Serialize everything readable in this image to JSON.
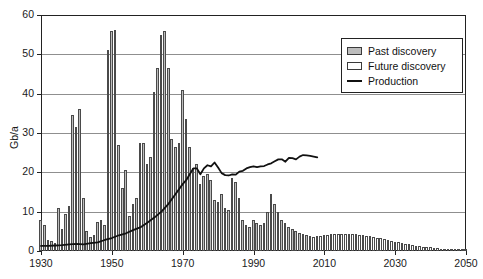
{
  "chart_data": {
    "type": "bar",
    "title": "",
    "xlabel": "",
    "ylabel": "Gb/a",
    "xlim": [
      1930,
      2050
    ],
    "ylim": [
      0,
      60
    ],
    "grid": "horizontal",
    "legend_position": "top-right",
    "x_ticks": [
      1930,
      1950,
      1970,
      1990,
      2010,
      2030,
      2050
    ],
    "y_ticks": [
      0,
      10,
      20,
      30,
      40,
      50,
      60
    ],
    "legend": [
      {
        "label": "Past discovery",
        "marker": "filled-gray-box",
        "color": "#bdbdbd"
      },
      {
        "label": "Future discovery",
        "marker": "empty-white-box",
        "color": "#ffffff"
      },
      {
        "label": "Production",
        "marker": "black-line",
        "color": "#111111"
      }
    ],
    "discovery_split_year": 2006,
    "series": [
      {
        "name": "Past discovery",
        "type": "bar",
        "x": [
          1930,
          1931,
          1932,
          1933,
          1934,
          1935,
          1936,
          1937,
          1938,
          1939,
          1940,
          1941,
          1942,
          1943,
          1944,
          1945,
          1946,
          1947,
          1948,
          1949,
          1950,
          1951,
          1952,
          1953,
          1954,
          1955,
          1956,
          1957,
          1958,
          1959,
          1960,
          1961,
          1962,
          1963,
          1964,
          1965,
          1966,
          1967,
          1968,
          1969,
          1970,
          1971,
          1972,
          1973,
          1974,
          1975,
          1976,
          1977,
          1978,
          1979,
          1980,
          1981,
          1982,
          1983,
          1984,
          1985,
          1986,
          1987,
          1988,
          1989,
          1990,
          1991,
          1992,
          1993,
          1994,
          1995,
          1996,
          1997,
          1998,
          1999,
          2000,
          2001,
          2002,
          2003,
          2004,
          2005
        ],
        "values": [
          8.0,
          6.5,
          2.8,
          2.5,
          2.0,
          11.0,
          5.5,
          9.5,
          11.5,
          34.5,
          31.5,
          36.0,
          13.5,
          5.0,
          3.5,
          4.0,
          7.5,
          8.0,
          6.5,
          51.0,
          56.0,
          56.2,
          27.0,
          16.0,
          20.5,
          9.0,
          12.0,
          13.5,
          27.5,
          27.5,
          22.0,
          24.0,
          40.5,
          46.5,
          55.0,
          56.0,
          46.5,
          28.5,
          26.5,
          27.5,
          41.0,
          33.5,
          26.5,
          21.0,
          22.0,
          17.0,
          19.0,
          19.5,
          18.0,
          13.0,
          12.5,
          14.5,
          11.0,
          10.5,
          18.5,
          17.5,
          13.5,
          8.0,
          6.5,
          6.0,
          8.0,
          7.0,
          6.5,
          7.0,
          10.0,
          14.5,
          12.0,
          10.0,
          8.0,
          7.0,
          6.0,
          5.5,
          5.0,
          4.5,
          4.2,
          4.0
        ]
      },
      {
        "name": "Future discovery",
        "type": "bar",
        "x": [
          2006,
          2007,
          2008,
          2009,
          2010,
          2011,
          2012,
          2013,
          2014,
          2015,
          2016,
          2017,
          2018,
          2019,
          2020,
          2021,
          2022,
          2023,
          2024,
          2025,
          2026,
          2027,
          2028,
          2029,
          2030,
          2031,
          2032,
          2033,
          2034,
          2035,
          2036,
          2037,
          2038,
          2039,
          2040,
          2041,
          2042,
          2043,
          2044,
          2045,
          2046,
          2047,
          2048,
          2049,
          2050
        ],
        "values": [
          3.8,
          3.6,
          3.7,
          3.8,
          4.0,
          4.1,
          4.2,
          4.3,
          4.3,
          4.4,
          4.4,
          4.4,
          4.3,
          4.2,
          4.1,
          4.0,
          3.9,
          3.7,
          3.6,
          3.4,
          3.2,
          3.0,
          2.8,
          2.6,
          2.4,
          2.2,
          2.0,
          1.9,
          1.7,
          1.6,
          1.4,
          1.3,
          1.1,
          1.0,
          0.9,
          0.8,
          0.7,
          0.6,
          0.5,
          0.4,
          0.35,
          0.3,
          0.25,
          0.2,
          0.15
        ]
      },
      {
        "name": "Production",
        "type": "line",
        "x": [
          1930,
          1932,
          1934,
          1936,
          1938,
          1940,
          1942,
          1944,
          1946,
          1948,
          1950,
          1952,
          1954,
          1956,
          1958,
          1960,
          1962,
          1964,
          1966,
          1968,
          1970,
          1971,
          1972,
          1973,
          1974,
          1975,
          1976,
          1977,
          1978,
          1979,
          1980,
          1981,
          1982,
          1983,
          1984,
          1985,
          1986,
          1987,
          1988,
          1989,
          1990,
          1991,
          1992,
          1993,
          1994,
          1995,
          1996,
          1997,
          1998,
          1999,
          2000,
          2001,
          2002,
          2003,
          2004,
          2005,
          2006,
          2007,
          2008
        ],
        "values": [
          1.3,
          1.3,
          1.4,
          1.5,
          1.7,
          1.8,
          1.7,
          2.0,
          2.2,
          2.8,
          3.3,
          4.0,
          4.5,
          5.3,
          6.0,
          7.2,
          8.5,
          10.0,
          12.0,
          14.5,
          17.0,
          18.0,
          19.5,
          21.0,
          21.0,
          19.5,
          21.0,
          21.8,
          21.5,
          22.5,
          21.2,
          19.8,
          19.3,
          19.2,
          19.5,
          19.4,
          20.2,
          20.4,
          21.0,
          21.3,
          21.5,
          21.3,
          21.5,
          21.6,
          22.0,
          22.3,
          22.8,
          23.3,
          23.3,
          22.7,
          23.7,
          23.6,
          23.3,
          24.0,
          24.4,
          24.3,
          24.2,
          24.0,
          23.8
        ]
      }
    ]
  }
}
